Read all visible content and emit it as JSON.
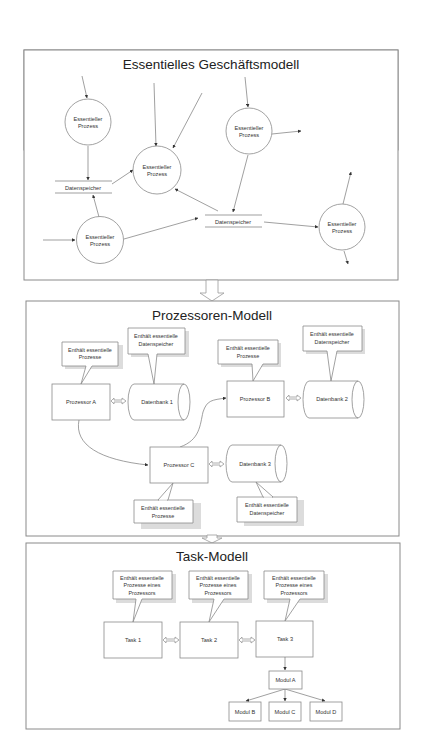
{
  "sections": {
    "business_model": {
      "title": "Essentielles Geschäftsmodell",
      "processes": [
        {
          "label_line1": "Essentieller",
          "label_line2": "Prozess"
        },
        {
          "label_line1": "Essentieller",
          "label_line2": "Prozess"
        },
        {
          "label_line1": "Essentieller",
          "label_line2": "Prozess"
        },
        {
          "label_line1": "Essentieller",
          "label_line2": "Prozess"
        },
        {
          "label_line1": "Essentieller",
          "label_line2": "Prozess"
        }
      ],
      "datastores": [
        {
          "label": "Datenspeicher"
        },
        {
          "label": "Datenspeicher"
        }
      ]
    },
    "processor_model": {
      "title": "Prozessoren-Modell",
      "processors": [
        {
          "label": "Prozessor  A"
        },
        {
          "label": "Prozessor  B"
        },
        {
          "label": "Prozessor  C"
        }
      ],
      "databases": [
        {
          "label": "Datenbank 1"
        },
        {
          "label": "Datenbank 2"
        },
        {
          "label": "Datenbank 3"
        }
      ],
      "callouts": {
        "processes": {
          "line1": "Enthält essentielle",
          "line2": "Prozesse"
        },
        "datastores": {
          "line1": "Enthält essentielle",
          "line2": "Datenspeicher"
        }
      }
    },
    "task_model": {
      "title": "Task-Modell",
      "tasks": [
        {
          "label": "Task 1"
        },
        {
          "label": "Task 2"
        },
        {
          "label": "Task 3"
        }
      ],
      "callout": {
        "line1": "Enthält essentielle",
        "line2": "Prozesse eines",
        "line3": "Prozessors"
      },
      "modules": [
        {
          "label": "Modul A"
        },
        {
          "label": "Modul B"
        },
        {
          "label": "Modul C"
        },
        {
          "label": "Modul D"
        }
      ]
    }
  }
}
